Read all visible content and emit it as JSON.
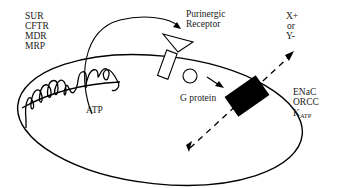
{
  "diagram": {
    "type": "cell-membrane-signaling-schematic",
    "transporter_labels": [
      "SUR",
      "CFTR",
      "MDR",
      "MRP"
    ],
    "atp_label": "ATP",
    "receptor_label": [
      "Purinergic",
      "Receptor"
    ],
    "g_protein_label": "G protein",
    "ion_labels": [
      "X+",
      "or",
      "Y-"
    ],
    "channel_labels": {
      "line1": "ENaC",
      "line2": "ORCC",
      "line3_main": "K",
      "line3_sub": "ATP"
    },
    "colors": {
      "stroke": "#000000",
      "text": "#1a1a1a",
      "channel_fill": "#000000",
      "background": "#ffffff"
    }
  }
}
